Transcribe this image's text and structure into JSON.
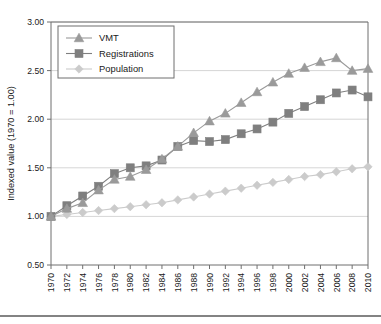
{
  "chart_data": {
    "type": "line",
    "title": "",
    "xlabel": "",
    "ylabel": "Indexed value (1970 = 1.00)",
    "x": [
      1970,
      1972,
      1974,
      1976,
      1978,
      1980,
      1982,
      1984,
      1986,
      1988,
      1990,
      1992,
      1994,
      1996,
      1998,
      2000,
      2002,
      2004,
      2006,
      2008,
      2010
    ],
    "xtick_labels": [
      "1970",
      "1972",
      "1974",
      "1976",
      "1978",
      "1980",
      "1982",
      "1984",
      "1986",
      "1988",
      "1990",
      "1992",
      "1994",
      "1996",
      "1998",
      "2000",
      "2002",
      "2004",
      "2006",
      "2008",
      "2010"
    ],
    "ytick_labels": [
      "0.50",
      "1.00",
      "1.50",
      "2.00",
      "2.50",
      "3.00"
    ],
    "yticks": [
      0.5,
      1.0,
      1.5,
      2.0,
      2.5,
      3.0
    ],
    "ylim": [
      0.5,
      3.0
    ],
    "xlim": [
      1970,
      2010
    ],
    "grid": "horizontal",
    "legend_position": "top-left",
    "series": [
      {
        "name": "VMT",
        "marker": "triangle",
        "color": "#9a9a9a",
        "values": [
          1.0,
          1.08,
          1.14,
          1.27,
          1.38,
          1.41,
          1.48,
          1.59,
          1.72,
          1.86,
          1.98,
          2.06,
          2.17,
          2.28,
          2.38,
          2.47,
          2.53,
          2.59,
          2.63,
          2.5,
          2.52
        ]
      },
      {
        "name": "Registrations",
        "marker": "square",
        "color": "#7f7f7f",
        "values": [
          1.0,
          1.11,
          1.21,
          1.31,
          1.44,
          1.5,
          1.52,
          1.58,
          1.72,
          1.78,
          1.77,
          1.79,
          1.85,
          1.9,
          1.97,
          2.06,
          2.13,
          2.2,
          2.27,
          2.3,
          2.23
        ]
      },
      {
        "name": "Population",
        "marker": "diamond",
        "color": "#cbcbcb",
        "values": [
          1.0,
          1.02,
          1.04,
          1.06,
          1.08,
          1.1,
          1.12,
          1.14,
          1.17,
          1.2,
          1.23,
          1.26,
          1.29,
          1.32,
          1.35,
          1.38,
          1.41,
          1.43,
          1.46,
          1.49,
          1.51
        ]
      }
    ]
  },
  "legend": {
    "items": [
      {
        "label": "VMT"
      },
      {
        "label": "Registrations"
      },
      {
        "label": "Population"
      }
    ]
  },
  "colors": {
    "vmt": "#9a9a9a",
    "registrations": "#7f7f7f",
    "population": "#cbcbcb",
    "axis": "#6f6f6f",
    "grid": "#d6d6d6",
    "text": "#1a1a1a",
    "footer_rule": "#5a5a5a"
  }
}
